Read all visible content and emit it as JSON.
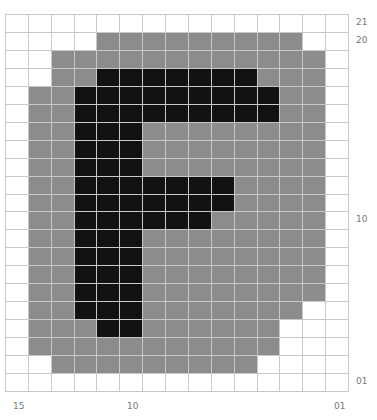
{
  "grid": {
    "columns": 15,
    "rows": 21,
    "legend": {
      "W": "empty",
      "G": "gray background",
      "B": "black letter pixel"
    },
    "colors": {
      "empty": "#ffffff",
      "gray": "#8c8c8c",
      "black": "#111111",
      "gridline": "#c8c8c8"
    },
    "cells": [
      "WWWWWWWWWWWWWWW",
      "WWWWGGGGGGGGGWW",
      "WWGGGGGGGGGGGGW",
      "WWGGBBBBBBBGGGW",
      "WGGBBBBBBBBBGGW",
      "WGGBBBBBBBBBGGW",
      "WGGBBBGGGGGGGGW",
      "WGGBBBGGGGGGGGW",
      "WGGBBBGGGGGGGGW",
      "WGGBBBBBBBGGGGW",
      "WGGBBBBBBBGGGGW",
      "WGGBBBBBBGGGGGW",
      "WGGBBBGGGGGGGGW",
      "WGGBBBGGGGGGGGW",
      "WGGBBBGGGGGGGGW",
      "WGGBBBGGGGGGGGW",
      "WGGBBBGGGGGGGWW",
      "WGGGBBGGGGGGWWW",
      "WGGGGGGGGGGGWWW",
      "WWGGGGGGGGGWWWW",
      "WWWWWWWWWWWWWWW"
    ]
  },
  "row_labels": {
    "top": "21",
    "second": "20",
    "middle": "10",
    "bottom": "01"
  },
  "column_labels": {
    "left": "15",
    "middle": "10",
    "right": "01"
  }
}
